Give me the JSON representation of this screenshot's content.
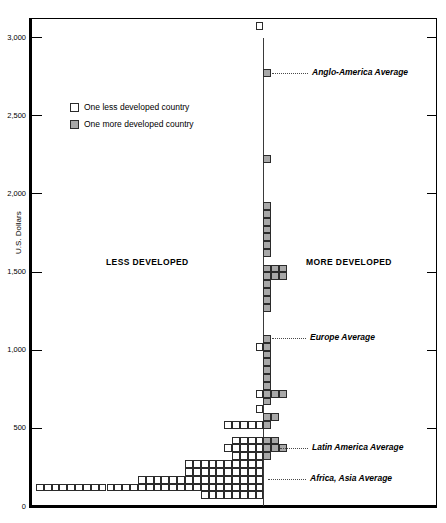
{
  "chart_data": {
    "type": "bar",
    "subtype": "back-to-back stacked dot histogram (population pyramid style)",
    "title": "",
    "xlabel": "",
    "ylabel": "U.S. Dollars",
    "ylim": [
      0,
      3100
    ],
    "ytick_values": [
      0,
      500,
      1000,
      1500,
      2000,
      2500,
      3000
    ],
    "ytick_labels": [
      "0",
      "500",
      "1,000",
      "1,500",
      "2,000",
      "2,500",
      "3,000"
    ],
    "grid": false,
    "bin_size": 50,
    "legend_position": "upper-left-inside",
    "legend": [
      {
        "key": "less",
        "label": "One less developed country",
        "color": "#ffffff",
        "border": "#2b2b2b"
      },
      {
        "key": "more",
        "label": "One more developed country",
        "color": "#a8a8a8",
        "border": "#2b2b2b"
      }
    ],
    "sections": [
      {
        "label": "LESS DEVELOPED",
        "side": "left"
      },
      {
        "label": "MORE DEVELOPED",
        "side": "right"
      }
    ],
    "annotations": [
      {
        "label": "Anglo-America Average",
        "value": 2750
      },
      {
        "label": "Europe Average",
        "value": 1050
      },
      {
        "label": "Latin America Average",
        "value": 350
      },
      {
        "label": "Africa, Asia Average",
        "value": 150
      }
    ],
    "bins": [
      {
        "value": 3050,
        "less": 1,
        "more": 0
      },
      {
        "value": 2750,
        "less": 0,
        "more": 1
      },
      {
        "value": 2200,
        "less": 0,
        "more": 1
      },
      {
        "value": 1900,
        "less": 0,
        "more": 1
      },
      {
        "value": 1850,
        "less": 0,
        "more": 1
      },
      {
        "value": 1800,
        "less": 0,
        "more": 1
      },
      {
        "value": 1750,
        "less": 0,
        "more": 1
      },
      {
        "value": 1700,
        "less": 0,
        "more": 1
      },
      {
        "value": 1650,
        "less": 0,
        "more": 1
      },
      {
        "value": 1600,
        "less": 0,
        "more": 1
      },
      {
        "value": 1500,
        "less": 0,
        "more": 3
      },
      {
        "value": 1450,
        "less": 0,
        "more": 3
      },
      {
        "value": 1400,
        "less": 0,
        "more": 1
      },
      {
        "value": 1350,
        "less": 0,
        "more": 1
      },
      {
        "value": 1300,
        "less": 0,
        "more": 1
      },
      {
        "value": 1250,
        "less": 0,
        "more": 1
      },
      {
        "value": 1050,
        "less": 0,
        "more": 1
      },
      {
        "value": 1000,
        "less": 1,
        "more": 1
      },
      {
        "value": 950,
        "less": 0,
        "more": 1
      },
      {
        "value": 900,
        "less": 0,
        "more": 1
      },
      {
        "value": 850,
        "less": 0,
        "more": 1
      },
      {
        "value": 800,
        "less": 0,
        "more": 1
      },
      {
        "value": 750,
        "less": 0,
        "more": 1
      },
      {
        "value": 700,
        "less": 1,
        "more": 3
      },
      {
        "value": 650,
        "less": 0,
        "more": 1
      },
      {
        "value": 600,
        "less": 1,
        "more": 0
      },
      {
        "value": 550,
        "less": 0,
        "more": 2
      },
      {
        "value": 500,
        "less": 5,
        "more": 1
      },
      {
        "value": 400,
        "less": 4,
        "more": 2
      },
      {
        "value": 350,
        "less": 5,
        "more": 3
      },
      {
        "value": 300,
        "less": 4,
        "more": 1
      },
      {
        "value": 250,
        "less": 10,
        "more": 0
      },
      {
        "value": 200,
        "less": 10,
        "more": 0
      },
      {
        "value": 150,
        "less": 16,
        "more": 0
      },
      {
        "value": 100,
        "less": 29,
        "more": 0
      },
      {
        "value": 50,
        "less": 8,
        "more": 0
      }
    ]
  }
}
